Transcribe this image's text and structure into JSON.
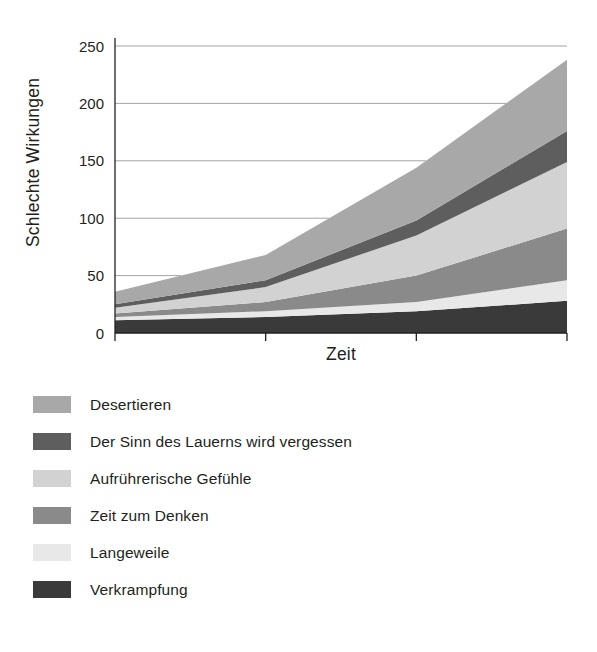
{
  "chart_data": {
    "type": "area",
    "stacked": true,
    "title": "",
    "xlabel": "Zeit",
    "ylabel": "Schlechte Wirkungen",
    "x": [
      0,
      1,
      2,
      3
    ],
    "xtick_labels": [
      "",
      "",
      "",
      ""
    ],
    "ytick_labels": [
      "0",
      "50",
      "100",
      "150",
      "200",
      "250"
    ],
    "yticks": [
      0,
      50,
      100,
      150,
      200,
      250
    ],
    "ylim": [
      0,
      250
    ],
    "xlim": [
      0,
      3
    ],
    "grid": true,
    "grid_axis": "y",
    "legend_position": "below",
    "series": [
      {
        "name": "Verkrampfung",
        "color": "#3a3a3a",
        "stack_order": 1,
        "values": [
          11,
          14,
          19,
          28
        ]
      },
      {
        "name": "Langeweile",
        "color": "#e8e8e8",
        "stack_order": 2,
        "values": [
          3,
          5,
          8,
          18
        ]
      },
      {
        "name": "Zeit zum Denken",
        "color": "#8a8a8a",
        "stack_order": 3,
        "values": [
          3,
          8,
          23,
          45
        ]
      },
      {
        "name": "Aufrührerische Gefühle",
        "color": "#d2d2d2",
        "stack_order": 4,
        "values": [
          5,
          13,
          35,
          58
        ]
      },
      {
        "name": "Der Sinn des Lauerns wird vergessen",
        "color": "#5e5e5e",
        "stack_order": 5,
        "values": [
          3,
          6,
          13,
          27
        ]
      },
      {
        "name": "Desertieren",
        "color": "#a8a8a8",
        "stack_order": 6,
        "values": [
          11,
          22,
          46,
          62
        ]
      }
    ],
    "cumulative_totals": [
      36,
      68,
      144,
      238
    ]
  },
  "legend": {
    "items": [
      {
        "label": "Desertieren",
        "color": "#a8a8a8"
      },
      {
        "label": "Der Sinn des Lauerns wird vergessen",
        "color": "#5e5e5e"
      },
      {
        "label": "Aufrührerische Gefühle",
        "color": "#d2d2d2"
      },
      {
        "label": "Zeit zum Denken",
        "color": "#8a8a8a"
      },
      {
        "label": "Langeweile",
        "color": "#e8e8e8"
      },
      {
        "label": "Verkrampfung",
        "color": "#3a3a3a"
      }
    ]
  },
  "axes": {
    "y_title": "Schlechte Wirkungen",
    "x_title": "Zeit"
  },
  "colors": {
    "axis": "#231f20",
    "grid": "#9a9a9a",
    "background": "#ffffff",
    "text": "#231f20"
  }
}
